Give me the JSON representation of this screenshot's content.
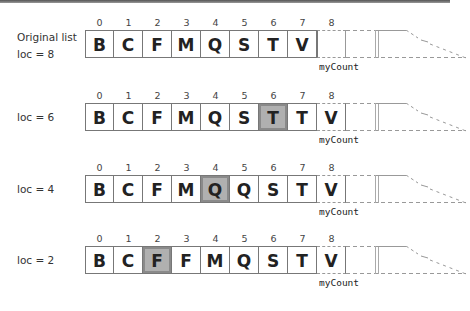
{
  "indices": [
    "0",
    "1",
    "2",
    "3",
    "4",
    "5",
    "6",
    "7",
    "8"
  ],
  "pointer_label": "myCount",
  "highlight_color": "#b0b0b0",
  "rows": [
    {
      "label_line1": "Original list",
      "label_line2": "loc = 8",
      "cells": [
        "B",
        "C",
        "F",
        "M",
        "Q",
        "S",
        "T",
        "V",
        ""
      ],
      "highlight": -1
    },
    {
      "label_line1": "loc = 6",
      "label_line2": "",
      "cells": [
        "B",
        "C",
        "F",
        "M",
        "Q",
        "S",
        "T",
        "T",
        "V"
      ],
      "highlight": 6
    },
    {
      "label_line1": "loc = 4",
      "label_line2": "",
      "cells": [
        "B",
        "C",
        "F",
        "M",
        "Q",
        "Q",
        "S",
        "T",
        "V"
      ],
      "highlight": 4
    },
    {
      "label_line1": "loc = 2",
      "label_line2": "",
      "cells": [
        "B",
        "C",
        "F",
        "F",
        "M",
        "Q",
        "S",
        "T",
        "V"
      ],
      "highlight": 2
    }
  ]
}
